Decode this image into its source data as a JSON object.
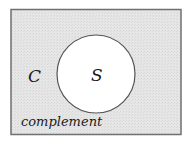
{
  "diagram": {
    "universe": {
      "fill": "#e4e4e4",
      "stroke": "#6e6e6e"
    },
    "set": {
      "label": "S",
      "fill": "#ffffff",
      "stroke": "#555555"
    },
    "complement_set_label": "C",
    "region_caption": "complement"
  }
}
